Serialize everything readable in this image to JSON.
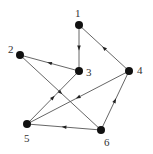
{
  "diagram": {
    "type": "directed-graph",
    "colors": {
      "node": "#111111",
      "edge": "#555555",
      "label": "#333333"
    },
    "nodes": [
      {
        "id": "1",
        "label": "1",
        "x": 79,
        "y": 25,
        "lx": 75,
        "ly": 17
      },
      {
        "id": "2",
        "label": "2",
        "x": 20,
        "y": 55,
        "lx": 8,
        "ly": 53
      },
      {
        "id": "3",
        "label": "3",
        "x": 79,
        "y": 71,
        "lx": 86,
        "ly": 76
      },
      {
        "id": "4",
        "label": "4",
        "x": 129,
        "y": 71,
        "lx": 137,
        "ly": 74
      },
      {
        "id": "5",
        "label": "5",
        "x": 27,
        "y": 124,
        "lx": 24,
        "ly": 142
      },
      {
        "id": "6",
        "label": "6",
        "x": 101,
        "y": 130,
        "lx": 104,
        "ly": 146
      }
    ],
    "edges": [
      {
        "from": "1",
        "to": "3"
      },
      {
        "from": "4",
        "to": "1"
      },
      {
        "from": "3",
        "to": "2"
      },
      {
        "from": "2",
        "to": "6"
      },
      {
        "from": "5",
        "to": "3"
      },
      {
        "from": "4",
        "to": "5"
      },
      {
        "from": "6",
        "to": "4"
      },
      {
        "from": "6",
        "to": "5"
      }
    ]
  }
}
